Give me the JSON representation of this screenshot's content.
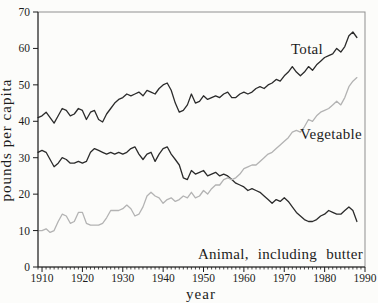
{
  "figure": {
    "background": "#fcfcfa",
    "frame_color": "#8f8f8f",
    "axis_color": "#1c1c1c",
    "text_color": "#1c1c1c"
  },
  "chart_data": {
    "type": "line",
    "title": "",
    "xlabel": "year",
    "ylabel": "pounds per capita",
    "xlim": [
      1909,
      1990
    ],
    "ylim": [
      0,
      70
    ],
    "x_ticks": [
      1910,
      1920,
      1930,
      1940,
      1950,
      1960,
      1970,
      1980,
      1990
    ],
    "y_ticks": [
      0,
      10,
      20,
      30,
      40,
      50,
      60,
      70
    ],
    "x_minor_tick_step": 1,
    "grid": false,
    "legend_position": "none",
    "x": [
      1909,
      1910,
      1911,
      1912,
      1913,
      1914,
      1915,
      1916,
      1917,
      1918,
      1919,
      1920,
      1921,
      1922,
      1923,
      1924,
      1925,
      1926,
      1927,
      1928,
      1929,
      1930,
      1931,
      1932,
      1933,
      1934,
      1935,
      1936,
      1937,
      1938,
      1939,
      1940,
      1941,
      1942,
      1943,
      1944,
      1945,
      1946,
      1947,
      1948,
      1949,
      1950,
      1951,
      1952,
      1953,
      1954,
      1955,
      1956,
      1957,
      1958,
      1959,
      1960,
      1961,
      1962,
      1963,
      1964,
      1965,
      1966,
      1967,
      1968,
      1969,
      1970,
      1971,
      1972,
      1973,
      1974,
      1975,
      1976,
      1977,
      1978,
      1979,
      1980,
      1981,
      1982,
      1983,
      1984,
      1985,
      1986,
      1987,
      1988
    ],
    "series": [
      {
        "name": "Total",
        "color": "#2b2b2b",
        "values": [
          41,
          41.5,
          42.5,
          41,
          39.5,
          41.5,
          43.5,
          43,
          41.5,
          42,
          43.5,
          43,
          40.5,
          42.5,
          43,
          40.5,
          39.8,
          42,
          43.5,
          45,
          46,
          46.5,
          47.5,
          47,
          47.5,
          48,
          47,
          48.5,
          48,
          47.5,
          49,
          50,
          50.5,
          48.5,
          45,
          42.5,
          43,
          44.5,
          47.5,
          45,
          45.5,
          47,
          46,
          46.5,
          47,
          46.5,
          47.5,
          48,
          46.5,
          46.5,
          47.5,
          48,
          47.5,
          48,
          49,
          49.5,
          49,
          50,
          50.5,
          51.5,
          51,
          52.5,
          53.5,
          55,
          53.5,
          52.5,
          53.5,
          55,
          54,
          55.5,
          56.5,
          57.5,
          58,
          58.5,
          60,
          59,
          60.5,
          63.5,
          64.5,
          63
        ]
      },
      {
        "name": "Animal, including butter",
        "color": "#2b2b2b",
        "values": [
          31.5,
          32,
          31.5,
          29.5,
          27.5,
          28.5,
          30,
          29.5,
          28.5,
          28.5,
          29,
          28.5,
          29,
          31.5,
          32.5,
          32,
          31.5,
          31,
          31.5,
          31,
          31.5,
          31,
          31.5,
          32.5,
          33,
          31,
          29.5,
          31,
          31.5,
          29,
          31,
          32.5,
          33,
          31,
          29.5,
          28,
          24.5,
          24,
          26.5,
          25.5,
          26,
          26.5,
          25,
          25.5,
          26,
          25,
          25.5,
          25,
          24,
          23,
          22.5,
          22,
          21,
          21.5,
          21,
          20.5,
          19.5,
          18.5,
          17.5,
          18.5,
          18,
          19,
          18,
          16.5,
          15,
          14,
          13,
          12.5,
          12.5,
          13,
          14,
          14.5,
          15.5,
          15,
          14.5,
          14.5,
          15.5,
          16.5,
          15.5,
          12.5
        ]
      },
      {
        "name": "Vegetable",
        "color": "#b3b3b3",
        "values": [
          10,
          10,
          10.5,
          9.5,
          10,
          12.5,
          14.5,
          14,
          12,
          12.5,
          15,
          15,
          12,
          11.5,
          11.5,
          11.5,
          12,
          13.5,
          15.5,
          15.5,
          15.5,
          16,
          17,
          16,
          14,
          14.5,
          16.5,
          19.5,
          20.5,
          19.5,
          19,
          17.5,
          18.5,
          19,
          18,
          18.5,
          19.5,
          19,
          20.5,
          19,
          19.5,
          21,
          20,
          21.5,
          22.5,
          22.5,
          24,
          24.5,
          24,
          24.5,
          25.5,
          27,
          27.5,
          28,
          28,
          29,
          30,
          31,
          31.5,
          32.5,
          33.5,
          34.5,
          35.5,
          37,
          37.5,
          37,
          38.5,
          40.5,
          40,
          41.5,
          42.5,
          43,
          43.5,
          44.5,
          45.5,
          44.5,
          46.5,
          49.5,
          51,
          52
        ]
      }
    ],
    "annotations": [
      {
        "text": "Total",
        "px": 307,
        "py": 54,
        "anchor": "middle",
        "word_spacing": 0
      },
      {
        "text": "Vegetable",
        "px": 331,
        "py": 139,
        "anchor": "middle",
        "word_spacing": 0
      },
      {
        "text": "Animal, including butter",
        "px": 363,
        "py": 259,
        "anchor": "end",
        "word_spacing": 5
      }
    ]
  }
}
